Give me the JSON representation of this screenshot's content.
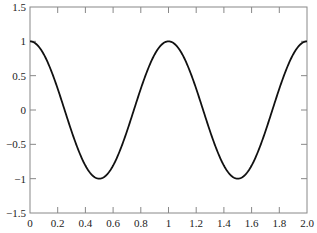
{
  "chart_data": {
    "type": "line",
    "title": "",
    "xlabel": "",
    "ylabel": "",
    "xlim": [
      0,
      2.0
    ],
    "ylim": [
      -1.5,
      1.5
    ],
    "grid": false,
    "legend": null,
    "x_ticks": [
      0,
      0.2,
      0.4,
      0.6,
      0.8,
      1,
      1.2,
      1.4,
      1.6,
      1.8,
      2.0
    ],
    "x_tick_labels": [
      "0",
      "0.2",
      "0.4",
      "0.6",
      "0.8",
      "1",
      "1.2",
      "1.4",
      "1.6",
      "1.8",
      "2.0"
    ],
    "y_ticks": [
      -1.5,
      -1,
      -0.5,
      0,
      0.5,
      1,
      1.5
    ],
    "y_tick_labels": [
      "-1.5",
      "-1",
      "-0.5",
      "0",
      "0.5",
      "1",
      "1.5"
    ],
    "series": [
      {
        "name": "cos(2πx)",
        "color": "#111111",
        "x": [
          0,
          0.1,
          0.2,
          0.25,
          0.3,
          0.4,
          0.5,
          0.6,
          0.7,
          0.75,
          0.8,
          0.9,
          1.0,
          1.1,
          1.2,
          1.25,
          1.3,
          1.4,
          1.5,
          1.6,
          1.7,
          1.75,
          1.8,
          1.9,
          2.0
        ],
        "values": [
          1,
          0.81,
          0.31,
          0,
          -0.31,
          -0.81,
          -1,
          -0.81,
          -0.31,
          0,
          0.31,
          0.81,
          1,
          0.81,
          0.31,
          0,
          -0.31,
          -0.81,
          -1,
          -0.81,
          -0.31,
          0,
          0.31,
          0.81,
          1
        ]
      }
    ]
  }
}
